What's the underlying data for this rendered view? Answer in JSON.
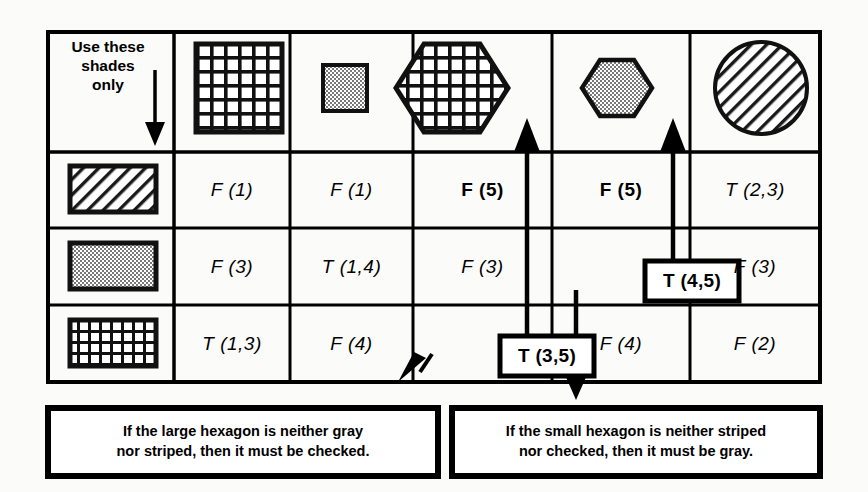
{
  "figure": {
    "corner_label": "Use these\nshades\nonly",
    "corner_arrow_icon": "down-arrow-icon"
  },
  "columns": [
    {
      "id": "col-shades",
      "shape": "none",
      "label": "Use these shades only"
    },
    {
      "id": "col-large-square",
      "shape": "square",
      "size": "large",
      "fill": "checked"
    },
    {
      "id": "col-small-square",
      "shape": "square",
      "size": "small",
      "fill": "gray"
    },
    {
      "id": "col-large-hexagon",
      "shape": "hexagon",
      "size": "large",
      "fill": "checked"
    },
    {
      "id": "col-small-hexagon",
      "shape": "hexagon",
      "size": "small",
      "fill": "gray"
    },
    {
      "id": "col-circle",
      "shape": "circle",
      "size": "large",
      "fill": "striped"
    }
  ],
  "rows": [
    {
      "id": "row-striped",
      "fill": "striped",
      "label": "striped"
    },
    {
      "id": "row-gray",
      "fill": "gray",
      "label": "gray"
    },
    {
      "id": "row-checked",
      "fill": "checked",
      "label": "checked"
    }
  ],
  "grid": [
    [
      {
        "value": "F (1)",
        "style": "italic",
        "boxed": false
      },
      {
        "value": "F (1)",
        "style": "italic",
        "boxed": false
      },
      {
        "value": "F (5)",
        "style": "bold",
        "boxed": false
      },
      {
        "value": "F (5)",
        "style": "bold",
        "boxed": false
      },
      {
        "value": "T (2,3)",
        "style": "italic",
        "boxed": false
      }
    ],
    [
      {
        "value": "F (3)",
        "style": "italic",
        "boxed": false
      },
      {
        "value": "T (1,4)",
        "style": "italic",
        "boxed": false
      },
      {
        "value": "F (3)",
        "style": "italic",
        "boxed": false
      },
      {
        "value": "T (4,5)",
        "style": "bold",
        "boxed": true
      },
      {
        "value": "F (3)",
        "style": "italic",
        "boxed": false
      }
    ],
    [
      {
        "value": "T (1,3)",
        "style": "italic",
        "boxed": false
      },
      {
        "value": "F (4)",
        "style": "italic",
        "boxed": false
      },
      {
        "value": "T (3,5)",
        "style": "bold",
        "boxed": true
      },
      {
        "value": "F (4)",
        "style": "italic",
        "boxed": false
      },
      {
        "value": "F (2)",
        "style": "italic",
        "boxed": false
      }
    ]
  ],
  "captions": [
    {
      "id": "caption-large-hexagon",
      "line1": "If the large hexagon is neither gray",
      "line2": "nor striped, then it must be checked."
    },
    {
      "id": "caption-small-hexagon",
      "line1": "If the small hexagon is neither striped",
      "line2": "nor checked, then it must be gray."
    }
  ],
  "connectors": [
    {
      "id": "arrow-t35-to-large-hexagon",
      "icon": "up-arrow-icon"
    },
    {
      "id": "arrow-t45-to-small-hexagon",
      "icon": "up-arrow-icon"
    },
    {
      "id": "arrow-t35-to-caption-left",
      "icon": "down-left-arrow-icon"
    },
    {
      "id": "arrow-t45-to-caption-right",
      "icon": "down-arrow-icon"
    }
  ],
  "colors": {
    "ink": "#000000",
    "paper": "#fbfbf9",
    "gray_fill": "#d9d9d9"
  }
}
